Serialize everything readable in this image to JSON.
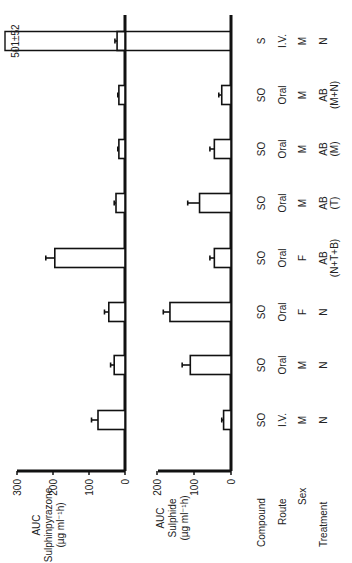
{
  "chart_data": [
    {
      "type": "bar",
      "panel": "top",
      "ylabel": "AUC Sulphinpyrazone (µg ml⁻¹h)",
      "ylabel_lines": [
        "AUC",
        "Sulphinpyrazone",
        "(µg ml⁻¹h)"
      ],
      "yticks": [
        0,
        100,
        200,
        300
      ],
      "ylim": [
        0,
        300
      ],
      "categories": [
        "1",
        "2",
        "3",
        "4",
        "5",
        "6",
        "7",
        "8"
      ],
      "values": [
        75,
        30,
        45,
        195,
        25,
        17,
        17,
        22
      ],
      "errors": [
        18,
        10,
        12,
        25,
        5,
        3,
        3,
        6
      ]
    },
    {
      "type": "bar",
      "panel": "bottom",
      "ylabel": "AUC Sulphide (µg ml⁻¹h)",
      "ylabel_lines": [
        "AUC",
        "Sulphide",
        "(µg ml⁻¹h)"
      ],
      "yticks": [
        0,
        100,
        200
      ],
      "ylim": [
        0,
        200
      ],
      "categories": [
        "1",
        "2",
        "3",
        "4",
        "5",
        "6",
        "7",
        "8"
      ],
      "values": [
        20,
        110,
        165,
        45,
        85,
        45,
        25,
        501
      ],
      "errors": [
        5,
        22,
        18,
        12,
        32,
        12,
        8,
        52
      ],
      "annotation": "501±52",
      "broken_bar_index": 7
    }
  ],
  "table": {
    "row_labels": [
      "Compound",
      "Route",
      "Sex",
      "Treatment"
    ],
    "columns": [
      {
        "compound": "SO",
        "route": "I.V.",
        "sex": "M",
        "treatment": "N",
        "treatment2": ""
      },
      {
        "compound": "SO",
        "route": "Oral",
        "sex": "M",
        "treatment": "N",
        "treatment2": ""
      },
      {
        "compound": "SO",
        "route": "Oral",
        "sex": "F",
        "treatment": "N",
        "treatment2": ""
      },
      {
        "compound": "SO",
        "route": "Oral",
        "sex": "F",
        "treatment": "AB",
        "treatment2": "(N+T+B)"
      },
      {
        "compound": "SO",
        "route": "Oral",
        "sex": "M",
        "treatment": "AB",
        "treatment2": "(T)"
      },
      {
        "compound": "SO",
        "route": "Oral",
        "sex": "M",
        "treatment": "AB",
        "treatment2": "(M)"
      },
      {
        "compound": "SO",
        "route": "Oral",
        "sex": "M",
        "treatment": "AB",
        "treatment2": "(M+N)"
      },
      {
        "compound": "S",
        "route": "I.V.",
        "sex": "M",
        "treatment": "N",
        "treatment2": ""
      }
    ]
  },
  "annotation_text": "501±52"
}
